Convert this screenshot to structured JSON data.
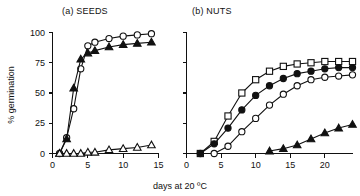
{
  "figure": {
    "caption_x": "days at 20 ºC",
    "ylabel": "% germination"
  },
  "chart_data": [
    {
      "type": "line",
      "title": "(a) SEEDS",
      "xlabel": "days at 20 ºC",
      "ylabel": "% germination",
      "xlim": [
        0,
        15
      ],
      "ylim": [
        0,
        100
      ],
      "xticks": [
        0,
        5,
        10,
        15
      ],
      "xtick_labels": [
        "0",
        "5",
        "10",
        "15"
      ],
      "yticks": [
        0,
        25,
        50,
        75,
        100
      ],
      "ytick_labels": [
        "0",
        "25",
        "50",
        "75",
        "100"
      ],
      "grid": false,
      "legend": "none",
      "series": [
        {
          "name": "open-circle",
          "marker": "open-circle",
          "x": [
            1,
            2,
            3,
            4,
            5,
            6,
            8,
            10,
            12,
            14
          ],
          "values": [
            0,
            13,
            37,
            70,
            89,
            92,
            95,
            97,
            98,
            99
          ]
        },
        {
          "name": "filled-triangle",
          "marker": "filled-triangle",
          "x": [
            1,
            2,
            3,
            4,
            5,
            6,
            8,
            10,
            12,
            14
          ],
          "values": [
            0,
            12,
            54,
            78,
            83,
            85,
            88,
            90,
            91,
            92
          ]
        },
        {
          "name": "open-triangle",
          "marker": "open-triangle",
          "x": [
            1,
            2,
            3,
            4,
            5,
            6,
            8,
            10,
            12,
            14
          ],
          "values": [
            0,
            0,
            0,
            0,
            1,
            1,
            3,
            4,
            5,
            7
          ]
        }
      ]
    },
    {
      "type": "line",
      "title": "(b) NUTS",
      "xlabel": "days at 20 ºC",
      "ylabel": "% germination",
      "xlim": [
        0,
        24
      ],
      "ylim": [
        0,
        100
      ],
      "xticks": [
        0,
        5,
        10,
        15,
        20
      ],
      "xtick_labels": [
        "0",
        "5",
        "10",
        "15",
        "20"
      ],
      "yticks": [
        0,
        25,
        50,
        75,
        100
      ],
      "ytick_labels": [
        "",
        "",
        "",
        "",
        ""
      ],
      "grid": false,
      "legend": "none",
      "series": [
        {
          "name": "open-square",
          "marker": "open-square",
          "x": [
            2,
            4,
            6,
            8,
            10,
            12,
            14,
            16,
            18,
            20,
            22,
            24
          ],
          "values": [
            0,
            10,
            31,
            50,
            61,
            68,
            72,
            74,
            75,
            76,
            76,
            76
          ]
        },
        {
          "name": "filled-circle",
          "marker": "filled-circle",
          "x": [
            2,
            4,
            6,
            8,
            10,
            12,
            14,
            16,
            18,
            20,
            22,
            24
          ],
          "values": [
            0,
            8,
            21,
            36,
            48,
            56,
            62,
            66,
            68,
            70,
            71,
            71
          ]
        },
        {
          "name": "open-circle",
          "marker": "open-circle",
          "x": [
            4,
            6,
            8,
            10,
            12,
            14,
            16,
            18,
            20,
            22,
            24
          ],
          "values": [
            0,
            6,
            18,
            29,
            40,
            49,
            56,
            61,
            63,
            64,
            65
          ]
        },
        {
          "name": "filled-triangle",
          "marker": "filled-triangle",
          "x": [
            12,
            14,
            16,
            18,
            20,
            22,
            24
          ],
          "values": [
            2,
            4,
            7,
            12,
            17,
            21,
            24
          ]
        }
      ]
    }
  ]
}
